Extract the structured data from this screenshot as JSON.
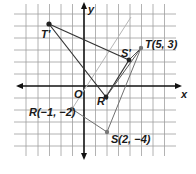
{
  "diagram": {
    "type": "coordinate-plane-transformation",
    "axes": {
      "x_label": "x",
      "y_label": "y",
      "origin_label": "O"
    },
    "grid": {
      "x_range": [
        -5,
        6
      ],
      "y_range": [
        -5,
        6
      ]
    },
    "colors": {
      "grid": "#9a9a9a",
      "axis": "#111111",
      "figure": "#333333",
      "guide": "#b0b0b0",
      "point": "#222222"
    },
    "points": [
      {
        "name": "R",
        "label": "R(−1, −2)",
        "x": -1,
        "y": -2,
        "image": false
      },
      {
        "name": "S",
        "label": "S(2, −4)",
        "x": 2,
        "y": -4,
        "image": false
      },
      {
        "name": "T",
        "label": "T(5, 3)",
        "x": 5,
        "y": 3,
        "image": false
      },
      {
        "name": "R'",
        "label": "R'",
        "image": true
      },
      {
        "name": "S'",
        "label": "S'",
        "image": true
      },
      {
        "name": "T'",
        "label": "T'",
        "image": true
      }
    ],
    "labels": {
      "R": "R(−1, −2)",
      "S": "S(2, −4)",
      "T": "T(5, 3)",
      "Rp": "R'",
      "Sp": "S'",
      "Tp": "T'",
      "O": "O",
      "x": "x",
      "y": "y"
    }
  }
}
